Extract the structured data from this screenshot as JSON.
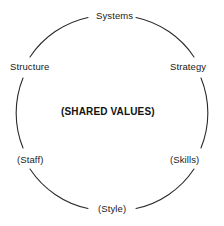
{
  "diagram": {
    "title": "(SHARED VALUES)",
    "shape": "circle",
    "stroke_color": "#2b2b2b",
    "text_color": "#1a1a1a",
    "background_color": "#ffffff",
    "center": {
      "label": "(SHARED VALUES)",
      "name": "shared-values"
    },
    "nodes": [
      {
        "label": "Systems",
        "name": "systems",
        "position": "top"
      },
      {
        "label": "Strategy",
        "name": "strategy",
        "position": "upper-right"
      },
      {
        "label": "(Skills)",
        "name": "skills",
        "position": "lower-right"
      },
      {
        "label": "(Style)",
        "name": "style",
        "position": "bottom"
      },
      {
        "label": "(Staff)",
        "name": "staff",
        "position": "lower-left"
      },
      {
        "label": "Structure",
        "name": "structure",
        "position": "upper-left"
      }
    ]
  }
}
